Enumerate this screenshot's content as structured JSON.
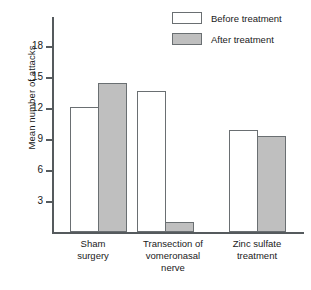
{
  "chart_data": {
    "type": "bar",
    "title": "",
    "xlabel": "",
    "ylabel": "Mean number of attacks",
    "categories": [
      "Sham surgery",
      "Transection of vomeronasal nerve",
      "Zinc sulfate treatment"
    ],
    "series": [
      {
        "name": "Before treatment",
        "values": [
          12.0,
          13.6,
          9.8
        ],
        "color": "#ffffff"
      },
      {
        "name": "After treatment",
        "values": [
          14.3,
          1.0,
          9.2
        ],
        "color": "#bfbfbf"
      }
    ],
    "ylim": [
      0,
      19.5
    ],
    "yticks": [
      3,
      6,
      9,
      12,
      15,
      18
    ],
    "ytick_labels": [
      "3",
      "6",
      "9",
      "12",
      "15",
      "18"
    ],
    "grid": false,
    "legend_position": "top-right"
  },
  "axis": {
    "y_label": "Mean number of attacks",
    "ticks": [
      {
        "value": 18,
        "label": "18"
      },
      {
        "value": 15,
        "label": "15"
      },
      {
        "value": 12,
        "label": "12"
      },
      {
        "value": 9,
        "label": "9"
      },
      {
        "value": 6,
        "label": "6"
      },
      {
        "value": 3,
        "label": "3"
      }
    ]
  },
  "legend": {
    "items": [
      {
        "label": "Before treatment",
        "swatch": "white"
      },
      {
        "label": "After treatment",
        "swatch": "gray"
      }
    ]
  },
  "groups": [
    {
      "label_line1": "Sham",
      "label_line2": "surgery",
      "label_line3": ""
    },
    {
      "label_line1": "Transection of",
      "label_line2": "vomeronasal",
      "label_line3": "nerve"
    },
    {
      "label_line1": "Zinc sulfate",
      "label_line2": "treatment",
      "label_line3": ""
    }
  ]
}
